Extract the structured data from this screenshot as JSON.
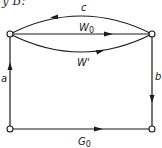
{
  "caption_fragment": "y B:",
  "diagram": {
    "nodes": [
      {
        "id": "top-left",
        "x": 10,
        "y": 34
      },
      {
        "id": "top-right",
        "x": 152,
        "y": 34
      },
      {
        "id": "bottom-left",
        "x": 10,
        "y": 129
      },
      {
        "id": "bottom-right",
        "x": 152,
        "y": 129
      }
    ],
    "edges": {
      "c": {
        "label": "c",
        "from": "top-right",
        "to": "top-left",
        "shape": "upper-arc"
      },
      "w0": {
        "label": "W",
        "sub": "0",
        "from": "top-left",
        "to": "top-right",
        "shape": "straight"
      },
      "wprime": {
        "label": "W'",
        "from": "top-left",
        "to": "top-right",
        "shape": "lower-arc"
      },
      "a": {
        "label": "a",
        "from": "bottom-left",
        "to": "top-left",
        "shape": "straight"
      },
      "b": {
        "label": "b",
        "from": "top-right",
        "to": "bottom-right",
        "shape": "straight"
      },
      "g0": {
        "label": "G",
        "sub": "0",
        "from": "bottom-left",
        "to": "bottom-right",
        "shape": "straight"
      }
    },
    "colors": {
      "stroke": "#1a1a1a",
      "node_fill": "#ffffff"
    }
  }
}
